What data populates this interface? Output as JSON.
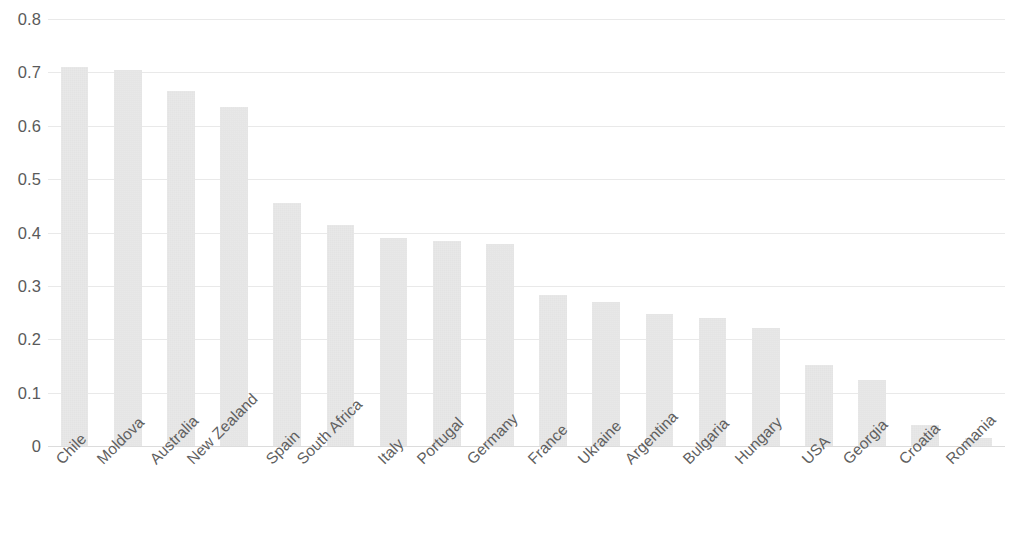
{
  "chart_data": {
    "type": "bar",
    "title": "",
    "subtitle": "",
    "xlabel": "",
    "ylabel": "",
    "categories": [
      "Chile",
      "Moldova",
      "Australia",
      "New Zealand",
      "Spain",
      "South Africa",
      "Italy",
      "Portugal",
      "Germany",
      "France",
      "Ukraine",
      "Argentina",
      "Bulgaria",
      "Hungary",
      "USA",
      "Georgia",
      "Croatia",
      "Romania"
    ],
    "values": [
      0.71,
      0.705,
      0.665,
      0.635,
      0.455,
      0.415,
      0.39,
      0.385,
      0.378,
      0.282,
      0.27,
      0.247,
      0.24,
      0.222,
      0.152,
      0.124,
      0.039,
      0.015
    ],
    "ylim": [
      0,
      0.8
    ],
    "ytick_labels": [
      "0.8",
      "0.7",
      "0.6",
      "0.5",
      "0.4",
      "0.3",
      "0.2",
      "0.1",
      "0"
    ],
    "ytick_values": [
      0.8,
      0.7,
      0.6,
      0.5,
      0.4,
      0.3,
      0.2,
      0.1,
      0
    ],
    "grid": true,
    "grid_axis": "y",
    "legend": false,
    "legend_position": "none",
    "bar_color": "#d4d4d4",
    "grid_color": "#e9e9e9",
    "axis_text_color": "#5a5a5a",
    "x_tick_rotation": -45,
    "background_color": "#ffffff"
  }
}
